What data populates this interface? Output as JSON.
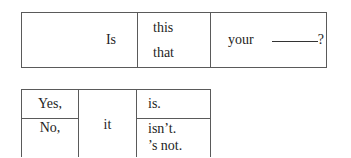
{
  "question_table": {
    "verb": "Is",
    "demonstratives": [
      "this",
      "that"
    ],
    "possessive": "your",
    "blank": "______",
    "end_punctuation": "?"
  },
  "answer_table": {
    "rows": [
      {
        "response": "Yes,",
        "verb_forms": [
          "is."
        ]
      },
      {
        "response": "No,",
        "verb_forms": [
          "isn’t.",
          "’s not."
        ]
      }
    ],
    "subject": "it"
  }
}
